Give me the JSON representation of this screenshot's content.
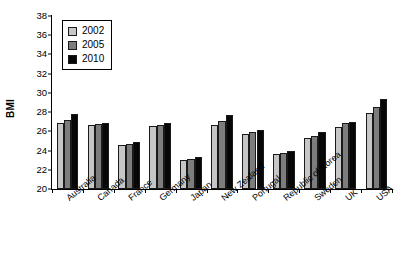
{
  "chart_data": {
    "type": "bar",
    "title": "",
    "xlabel": "",
    "ylabel": "BMI",
    "ylim": [
      20,
      38
    ],
    "ytick_step": 2,
    "yticks": [
      20,
      22,
      24,
      26,
      28,
      30,
      32,
      34,
      36,
      38
    ],
    "grid": false,
    "legend_position": "top-left",
    "categories": [
      "Australia",
      "Canada",
      "France",
      "Germany",
      "Japan",
      "New Zealand",
      "Portugal",
      "Republic of Korea",
      "Sweden",
      "UK",
      "USA"
    ],
    "series": [
      {
        "name": "2002",
        "color": "#c6c6c6",
        "values": [
          26.9,
          26.7,
          24.6,
          26.6,
          23.0,
          26.7,
          25.7,
          23.6,
          25.3,
          26.5,
          27.9
        ]
      },
      {
        "name": "2005",
        "color": "#7d7d7d",
        "values": [
          27.2,
          26.8,
          24.7,
          26.7,
          23.1,
          27.1,
          25.9,
          23.7,
          25.5,
          26.9,
          28.5
        ]
      },
      {
        "name": "2010",
        "color": "#070707",
        "values": [
          27.8,
          26.9,
          24.9,
          26.9,
          23.3,
          27.7,
          26.1,
          24.0,
          25.9,
          27.0,
          29.4
        ]
      }
    ]
  }
}
